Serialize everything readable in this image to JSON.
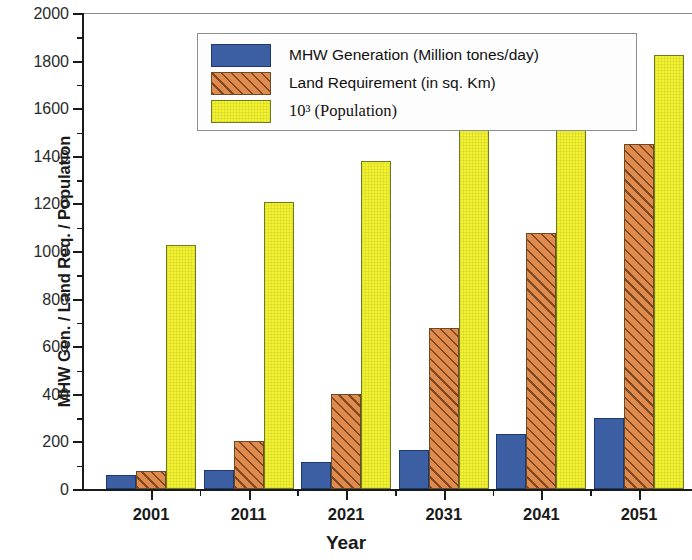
{
  "chart_data": {
    "type": "bar",
    "title": "",
    "xlabel": "Year",
    "ylabel": "MHW Gen. / Land Req. / Population",
    "categories": [
      "2001",
      "2011",
      "2021",
      "2031",
      "2041",
      "2051"
    ],
    "ylim": [
      0,
      2000
    ],
    "ytick_step": 200,
    "yticks": [
      "0",
      "200",
      "400",
      "600",
      "800",
      "1000",
      "1200",
      "1400",
      "1600",
      "1800",
      "2000"
    ],
    "minor_ticks": true,
    "grid": false,
    "legend_position": "top-left-inside",
    "series": [
      {
        "name": "MHW Generation (Million tones/day)",
        "color": "#3c5ea3",
        "pattern": "solid",
        "values": [
          60,
          80,
          112,
          162,
          232,
          300
        ]
      },
      {
        "name": "Land Requirement (in sq. Km)",
        "color": "#e08b4e",
        "pattern": "diagonal-hatch",
        "values": [
          75,
          200,
          400,
          675,
          1075,
          1450
        ]
      },
      {
        "name": "10³ (Population)",
        "color": "#f2f230",
        "pattern": "solid",
        "values": [
          1025,
          1205,
          1380,
          1545,
          1695,
          1825
        ]
      }
    ]
  },
  "axes": {
    "y_title": "MHW Gen. / Land Req. / Population",
    "x_title": "Year"
  },
  "legend": {
    "entries": [
      "MHW Generation (Million tones/day)",
      "Land Requirement (in sq. Km)",
      "10³ (Population)"
    ]
  }
}
